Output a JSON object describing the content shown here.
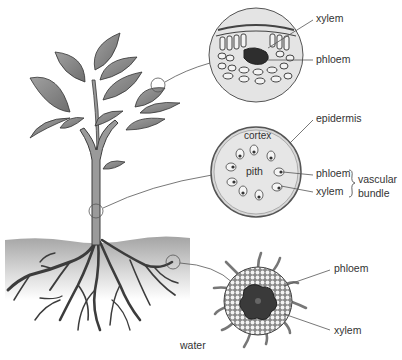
{
  "diagram": {
    "leaf_section": {
      "labels": {
        "xylem": "xylem",
        "phloem": "phloem"
      }
    },
    "stem_section": {
      "labels": {
        "epidermis": "epidermis",
        "cortex": "cortex",
        "pith": "pith",
        "phloem": "phloem",
        "xylem": "xylem",
        "vascular": "vascular",
        "bundle": "bundle"
      }
    },
    "root_section": {
      "labels": {
        "phloem": "phloem",
        "xylem": "xylem"
      }
    },
    "soil": {
      "label": "water"
    },
    "colors": {
      "line": "#444444",
      "leaf_fill": "#8a8a8a",
      "section_fill": "#e6e6e6",
      "dark_tissue": "#3a3a3a",
      "soil_top": "#a8a8a8",
      "soil_bottom": "#ffffff"
    }
  }
}
